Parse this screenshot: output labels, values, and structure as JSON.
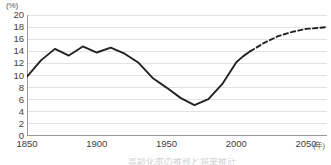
{
  "axes": {
    "y_unit_label": "(%)",
    "x_unit_label": "(年)",
    "y_ticks": [
      "0",
      "2",
      "4",
      "6",
      "8",
      "10",
      "12",
      "14",
      "16",
      "18",
      "20"
    ],
    "x_ticks": [
      "1850",
      "1900",
      "1950",
      "2000",
      "2050"
    ]
  },
  "caption": {
    "partial_text": "高齢化率の推移と将来推計"
  },
  "style": {
    "line_color": "#222222",
    "grid_color": "#e2e2e2",
    "axis_color": "#9a9a9a",
    "background": "#ffffff"
  },
  "chart_data": {
    "type": "line",
    "title": "",
    "subtitle": "",
    "xlabel": "(年)",
    "ylabel": "(%)",
    "xlim": [
      1850,
      2065
    ],
    "ylim": [
      0,
      20
    ],
    "y_tick_step": 2,
    "x_tick_step": 50,
    "grid": true,
    "grid_axis": "y",
    "legend": false,
    "legend_position": "none",
    "series": [
      {
        "name": "実績",
        "style": "solid",
        "color": "#222222",
        "x": [
          1850,
          1860,
          1870,
          1880,
          1890,
          1900,
          1910,
          1920,
          1930,
          1940,
          1950,
          1960,
          1970,
          1980,
          1990,
          2000,
          2005,
          2010
        ],
        "values": [
          9.8,
          12.5,
          14.4,
          13.3,
          14.8,
          13.8,
          14.6,
          13.6,
          12.1,
          9.6,
          8.0,
          6.3,
          5.1,
          6.1,
          8.6,
          12.2,
          13.2,
          14.0
        ]
      },
      {
        "name": "推計",
        "style": "dashed",
        "color": "#222222",
        "x": [
          2010,
          2020,
          2030,
          2040,
          2050,
          2060,
          2065
        ],
        "values": [
          14.0,
          15.4,
          16.5,
          17.2,
          17.7,
          17.9,
          18.0
        ]
      }
    ],
    "annotations": [
      {
        "label": "最大値(1890年頃)",
        "x": 1890,
        "y": 14.8
      },
      {
        "label": "最小値(1970年頃)",
        "x": 1970,
        "y": 5.1
      },
      {
        "label": "実績と推計の境目",
        "x": 2010,
        "y": 14.0
      }
    ]
  }
}
